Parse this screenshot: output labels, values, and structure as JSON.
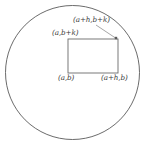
{
  "figure": {
    "name": "rectangle-inscribed-in-circle",
    "colors": {
      "background": "#ffffff",
      "circle_stroke": "#5a5a5a",
      "rectangle_stroke": "#6b6b6b",
      "leader_stroke": "#8f8f8f",
      "label_text": "#3a3a3a",
      "corner_marker": "#5a5a5a"
    },
    "circle": {
      "center_x": 72.5,
      "center_y": 72.5,
      "radius": 67,
      "stroke_width": 0.9
    },
    "rectangle": {
      "x": 68,
      "y": 39,
      "width": 50,
      "height": 34,
      "stroke_width": 0.9,
      "fill": "none"
    },
    "leader_line": {
      "x1": 96,
      "y1": 25,
      "x2": 117,
      "y2": 39
    },
    "corner_marker": {
      "x": 116,
      "y": 38,
      "size": 2.4
    },
    "labels": {
      "top_right": "(a+h,b+k)",
      "top_left": "(a,b+k)",
      "bottom_left": "(a,b)",
      "bottom_right": "(a+h,b)"
    }
  }
}
